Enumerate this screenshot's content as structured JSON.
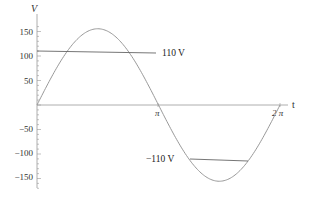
{
  "chart_data": {
    "type": "line",
    "title": "",
    "xlabel": "t",
    "ylabel": "V",
    "xlim": [
      0,
      6.2832
    ],
    "ylim": [
      -175,
      170
    ],
    "grid": false,
    "x_ticks": [
      {
        "value": 3.1416,
        "label": "π"
      },
      {
        "value": 6.2832,
        "label": "2 π"
      }
    ],
    "y_ticks": [
      {
        "value": 150,
        "label": "150"
      },
      {
        "value": 100,
        "label": "100"
      },
      {
        "value": 50,
        "label": "50"
      },
      {
        "value": -50,
        "label": "-50"
      },
      {
        "value": -100,
        "label": "-100"
      },
      {
        "value": -150,
        "label": "-150"
      }
    ],
    "series": [
      {
        "name": "V(t) = 155.6 sin t",
        "amplitude": 155.6,
        "function": "sin",
        "x": [
          0,
          0.785,
          1.571,
          2.356,
          3.142,
          3.927,
          4.712,
          5.498,
          6.283
        ],
        "values": [
          0,
          110,
          155.6,
          110,
          0,
          -110,
          -155.6,
          -110,
          0
        ]
      }
    ],
    "annotations": [
      {
        "text": "110  V",
        "value": 110,
        "line_from_x": 0,
        "line_to_x": 3.1
      },
      {
        "text": "−110 V",
        "value": -110,
        "line_from_x": 3.9,
        "line_to_x": 5.4
      }
    ]
  },
  "labels": {
    "y_axis": "V",
    "x_axis": "t",
    "ann_pos": "110  V",
    "ann_neg": "−110 V",
    "yt150": "150",
    "yt100": "100",
    "yt50": "50",
    "ytm50": "−50",
    "ytm100": "−100",
    "ytm150": "−150",
    "xt_pi": "π",
    "xt_2pi": "2 π"
  }
}
